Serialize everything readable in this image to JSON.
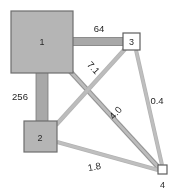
{
  "diagram": {
    "type": "weighted-node-graph",
    "background_color": "#ffffff",
    "node_fill_color": "#b5b5b5",
    "node_stroke_color": "#6e6e6e",
    "terminal_fill_color": "#ffffff",
    "edge_fill_color": "#b0b0b0",
    "edge_stroke_color": "#7a7a7a",
    "label_color": "#1f1f1f",
    "nodes": [
      {
        "id": "1",
        "label": "1",
        "shape": "square",
        "style": "filled",
        "x": 11,
        "y": 11,
        "w": 62,
        "h": 62,
        "label_x": 42,
        "label_y": 45
      },
      {
        "id": "2",
        "label": "2",
        "shape": "square",
        "style": "filled",
        "x": 24,
        "y": 121,
        "w": 33,
        "h": 31,
        "label_x": 40,
        "label_y": 140
      },
      {
        "id": "3",
        "label": "3",
        "shape": "square",
        "style": "outline",
        "x": 123,
        "y": 33,
        "w": 17,
        "h": 17,
        "label_x": 131.5,
        "label_y": 45
      },
      {
        "id": "4",
        "label": "4",
        "shape": "square",
        "style": "outline",
        "x": 158,
        "y": 165,
        "w": 9,
        "h": 9,
        "label_x": 162.5,
        "label_y": 188
      }
    ],
    "edges": [
      {
        "from": "1",
        "to": "3",
        "weight": "64",
        "thickness": 8,
        "x1": 73,
        "y1": 41.5,
        "x2": 123,
        "y2": 41.5,
        "label_x": 99,
        "label_y": 31,
        "label_rotation": 0
      },
      {
        "from": "1",
        "to": "2",
        "weight": "256",
        "thickness": 12,
        "x1": 42,
        "y1": 73,
        "x2": 42,
        "y2": 121,
        "label_x": 22,
        "label_y": 99,
        "label_rotation": 0
      },
      {
        "from": "1",
        "to": "4",
        "weight": "4.0",
        "thickness": 4,
        "x1": 69,
        "y1": 70,
        "x2": 158,
        "y2": 168,
        "label_x": 118,
        "label_y": 115,
        "label_rotation": -48
      },
      {
        "from": "3",
        "to": "2",
        "weight": "7.1",
        "thickness": 4,
        "x1": 124,
        "y1": 48,
        "x2": 56,
        "y2": 124,
        "label_x": 91,
        "label_y": 70,
        "label_rotation": 48
      },
      {
        "from": "3",
        "to": "4",
        "weight": "0.4",
        "thickness": 3.5,
        "x1": 135,
        "y1": 50,
        "x2": 161,
        "y2": 165,
        "label_x": 157,
        "label_y": 103,
        "label_rotation": 0
      },
      {
        "from": "2",
        "to": "4",
        "weight": "1.8",
        "thickness": 3.5,
        "x1": 57,
        "y1": 142,
        "x2": 158,
        "y2": 170,
        "label_x": 95,
        "label_y": 170,
        "label_rotation": -10
      }
    ]
  }
}
